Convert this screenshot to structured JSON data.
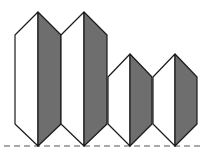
{
  "diagram": {
    "type": "hexagonal-prisms-row",
    "colors": {
      "light_face": "#ffffff",
      "dark_face": "#6e6e6e",
      "stroke": "#1a1a1a",
      "baseline": "#555555"
    },
    "baseline_y": 146,
    "prisms": [
      {
        "id": "prism-1",
        "cx": 38,
        "half_w": 23,
        "top": 12,
        "shoulder": 35,
        "lower_shoulder": 124,
        "bottom": 146
      },
      {
        "id": "prism-2",
        "cx": 84,
        "half_w": 23,
        "top": 12,
        "shoulder": 35,
        "lower_shoulder": 124,
        "bottom": 146
      },
      {
        "id": "prism-3",
        "cx": 130,
        "half_w": 22,
        "top": 54,
        "shoulder": 77,
        "lower_shoulder": 124,
        "bottom": 146
      },
      {
        "id": "prism-4",
        "cx": 175,
        "half_w": 22,
        "top": 54,
        "shoulder": 77,
        "lower_shoulder": 124,
        "bottom": 146
      }
    ]
  }
}
